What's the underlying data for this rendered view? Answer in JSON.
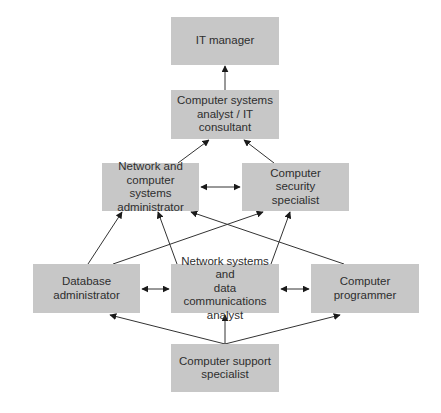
{
  "diagram": {
    "type": "career-path-flowchart",
    "colors": {
      "node_fill": "#c7c7c7",
      "node_text": "#2e2e2e",
      "edge": "#333333",
      "background": "#ffffff"
    },
    "nodes": {
      "it_manager": {
        "label": "IT manager"
      },
      "systems_analyst": {
        "label": "Computer systems\nanalyst / IT consultant"
      },
      "network_admin": {
        "label": "Network and\ncomputer systems\nadministrator"
      },
      "security_specialist": {
        "label": "Computer\nsecurity\nspecialist"
      },
      "database_admin": {
        "label": "Database\nadministrator"
      },
      "network_analyst": {
        "label": "Network systems and\ndata communications\nanalyst"
      },
      "programmer": {
        "label": "Computer\nprogrammer"
      },
      "support_specialist": {
        "label": "Computer support\nspecialist"
      }
    },
    "edges": [
      {
        "from": "systems_analyst",
        "to": "it_manager",
        "direction": "one-way"
      },
      {
        "from": "network_admin",
        "to": "systems_analyst",
        "direction": "one-way"
      },
      {
        "from": "security_specialist",
        "to": "systems_analyst",
        "direction": "one-way"
      },
      {
        "from": "network_admin",
        "to": "security_specialist",
        "direction": "two-way"
      },
      {
        "from": "database_admin",
        "to": "network_admin",
        "direction": "one-way"
      },
      {
        "from": "database_admin",
        "to": "security_specialist",
        "direction": "one-way"
      },
      {
        "from": "network_analyst",
        "to": "network_admin",
        "direction": "one-way"
      },
      {
        "from": "network_analyst",
        "to": "security_specialist",
        "direction": "one-way"
      },
      {
        "from": "programmer",
        "to": "network_admin",
        "direction": "one-way"
      },
      {
        "from": "database_admin",
        "to": "network_analyst",
        "direction": "two-way"
      },
      {
        "from": "network_analyst",
        "to": "programmer",
        "direction": "two-way"
      },
      {
        "from": "support_specialist",
        "to": "database_admin",
        "direction": "one-way"
      },
      {
        "from": "support_specialist",
        "to": "network_analyst",
        "direction": "one-way"
      },
      {
        "from": "support_specialist",
        "to": "programmer",
        "direction": "one-way"
      }
    ]
  }
}
